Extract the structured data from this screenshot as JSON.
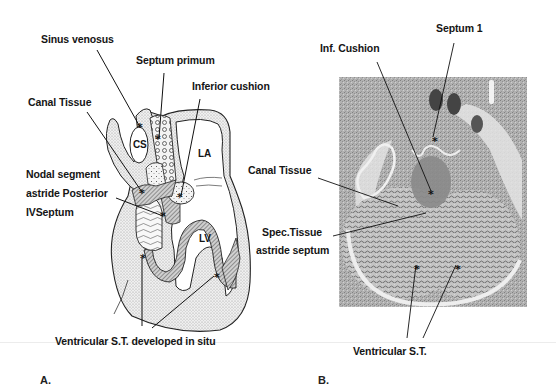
{
  "figure": {
    "panel_a": {
      "letter": "A.",
      "labels": {
        "sinus_venosus": "Sinus venosus",
        "septum_primum": "Septum primum",
        "inferior_cushion": "Inferior cushion",
        "canal_tissue": "Canal Tissue",
        "nodal_segment_line1": "Nodal segment",
        "nodal_segment_line2": "astride Posterior",
        "nodal_segment_line3": "IVSeptum",
        "ventricular_st": "Ventricular S.T. developed  in situ"
      },
      "chamber_labels": {
        "cs": "CS",
        "la": "LA",
        "lv": "LV"
      }
    },
    "panel_b": {
      "letter": "B.",
      "labels": {
        "septum_1": "Septum 1",
        "inf_cushion": "Inf. Cushion",
        "canal_tissue": "Canal Tissue",
        "spec_tissue_line1": "Spec.Tissue",
        "spec_tissue_line2": "astride septum",
        "ventricular_st": "Ventricular S.T."
      }
    },
    "colors": {
      "background": "#ffffff",
      "ink": "#151515",
      "stipple": "#d9d9d9",
      "hatch": "#6a6a6a",
      "histology_dark": "#555555",
      "histology_light": "#c8c8c8"
    }
  }
}
